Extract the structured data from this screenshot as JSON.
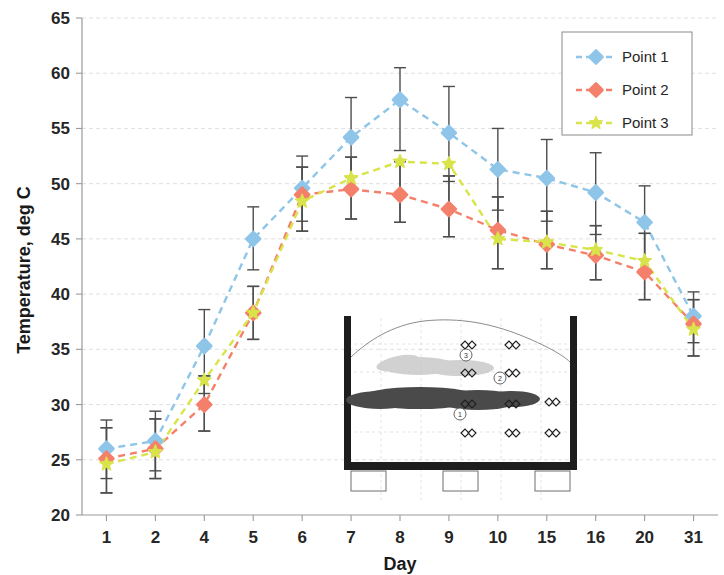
{
  "chart_data": {
    "type": "line",
    "title": "",
    "xlabel": "Day",
    "ylabel": "Temperature, deg C",
    "categories": [
      "1",
      "2",
      "4",
      "5",
      "6",
      "7",
      "8",
      "9",
      "10",
      "15",
      "16",
      "20",
      "31"
    ],
    "ylim": [
      20,
      65
    ],
    "ytick_step": 5,
    "yticks": [
      "20",
      "25",
      "30",
      "35",
      "40",
      "45",
      "50",
      "55",
      "60",
      "65"
    ],
    "grid": true,
    "legend_position": "top-right",
    "errorbars": true,
    "series": [
      {
        "name": "Point 1",
        "color": "#8EC5E8",
        "marker": "diamond",
        "linestyle": "dashed",
        "values": [
          26.0,
          26.7,
          35.3,
          45.0,
          49.6,
          54.2,
          57.6,
          54.6,
          51.3,
          50.5,
          49.2,
          46.5,
          38.0
        ],
        "err_low": [
          23.3,
          24.0,
          31.0,
          42.2,
          46.6,
          50.6,
          53.0,
          50.2,
          47.6,
          46.6,
          45.4,
          43.2,
          35.6
        ],
        "err_high": [
          28.6,
          29.4,
          38.6,
          47.9,
          52.5,
          57.8,
          60.5,
          58.8,
          55.0,
          54.0,
          52.8,
          49.8,
          40.2
        ]
      },
      {
        "name": "Point 2",
        "color": "#F4806B",
        "marker": "diamond",
        "linestyle": "dashed",
        "values": [
          25.1,
          26.0,
          30.0,
          38.3,
          49.0,
          49.5,
          49.0,
          47.7,
          45.8,
          44.5,
          43.5,
          42.0,
          37.3
        ],
        "err_low": [
          22.0,
          23.3,
          27.6,
          35.9,
          45.7,
          46.8,
          46.5,
          45.2,
          42.3,
          42.3,
          41.3,
          39.5,
          34.4
        ],
        "err_high": [
          27.9,
          28.7,
          32.6,
          40.7,
          51.5,
          52.4,
          52.0,
          50.7,
          48.8,
          47.5,
          46.2,
          45.5,
          39.5
        ]
      },
      {
        "name": "Point 3",
        "color": "#D8E44A",
        "marker": "star",
        "linestyle": "dashed",
        "values": [
          24.6,
          25.7,
          32.2,
          38.3,
          48.4,
          50.5,
          52.0,
          51.8,
          45.0,
          44.7,
          44.0,
          43.0,
          36.8
        ],
        "err_low": [
          22.0,
          23.3,
          27.6,
          35.9,
          45.7,
          46.8,
          46.5,
          45.2,
          42.3,
          42.3,
          41.3,
          39.5,
          34.4
        ],
        "err_high": [
          27.9,
          28.7,
          32.6,
          40.7,
          51.5,
          52.4,
          52.0,
          50.7,
          48.8,
          47.5,
          46.2,
          45.5,
          39.5
        ]
      }
    ]
  },
  "legend": {
    "items": [
      {
        "label": "Point 1",
        "color": "#8EC5E8"
      },
      {
        "label": "Point 2",
        "color": "#F4806B"
      },
      {
        "label": "Point 3",
        "color": "#D8E44A"
      }
    ]
  },
  "inset": {
    "caption": "",
    "point_labels": [
      "1",
      "2",
      "3"
    ]
  }
}
